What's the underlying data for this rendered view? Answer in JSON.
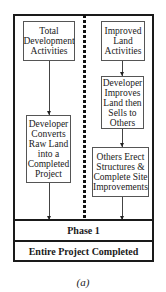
{
  "diagram": {
    "left_column": {
      "boxes": [
        {
          "label": "Total\nDevelopment\nActivities"
        },
        {
          "label": "Developer\nConverts\nRaw Land\ninto a\nCompleted\nProject"
        }
      ]
    },
    "right_column": {
      "boxes": [
        {
          "label": "Improved\nLand\nActivities"
        },
        {
          "label": "Developer\nImproves\nLand then\nSells to\nOthers"
        },
        {
          "label": "Others Erect\nStructures &\nComplete Site\nImprovements"
        }
      ]
    },
    "phase_label": "Phase 1",
    "completion_label": "Entire Project Completed",
    "caption": "(a)"
  }
}
